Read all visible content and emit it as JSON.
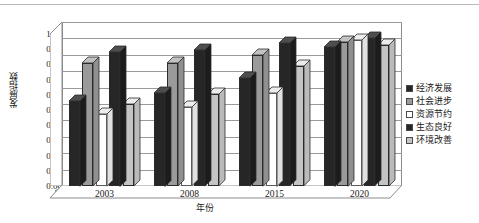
{
  "chart_data": {
    "type": "bar",
    "title": "",
    "xlabel": "年份",
    "ylabel": "发展指数",
    "categories": [
      "2003",
      "2008",
      "2015",
      "2020"
    ],
    "ylim": [
      0.0,
      1.0
    ],
    "ytick_labels": [
      "1.00",
      "0.90",
      "0.80",
      "0.70",
      "0.60",
      "0.50",
      "0.40",
      "0.30",
      "0.20",
      "0.10",
      "0.00"
    ],
    "ytick_values": [
      1.0,
      0.9,
      0.8,
      0.7,
      0.6,
      0.5,
      0.4,
      0.3,
      0.2,
      0.1,
      0.0
    ],
    "grid": true,
    "legend_position": "right",
    "style": "3d-clustered-column",
    "series": [
      {
        "name": "经济发展",
        "color": "#262626",
        "values": [
          0.52,
          0.57,
          0.66,
          0.85
        ]
      },
      {
        "name": "社会进步",
        "color": "#9a9a9a",
        "values": [
          0.75,
          0.75,
          0.8,
          0.88
        ]
      },
      {
        "name": "资源节约",
        "color": "#ffffff",
        "values": [
          0.44,
          0.48,
          0.57,
          0.89
        ]
      },
      {
        "name": "生态良好",
        "color": "#262626",
        "values": [
          0.82,
          0.83,
          0.87,
          0.9
        ]
      },
      {
        "name": "环境改善",
        "color": "#c4c4c4",
        "values": [
          0.5,
          0.56,
          0.73,
          0.86
        ]
      }
    ]
  },
  "legend": {
    "items": [
      {
        "label": "经济发展",
        "swatch": "#262626"
      },
      {
        "label": "社会进步",
        "swatch": "#9a9a9a"
      },
      {
        "label": "资源节约",
        "swatch": "#ffffff"
      },
      {
        "label": "生态良好",
        "swatch": "#262626"
      },
      {
        "label": "环境改善",
        "swatch": "#c4c4c4"
      }
    ]
  },
  "colors": {
    "axis": "#8c8c8c",
    "grid": "#9a9a9a",
    "text": "#1a1a1a",
    "plot_background": "#ffffff",
    "floor": "#e8e8e8",
    "wall": "#d8d8d8"
  }
}
